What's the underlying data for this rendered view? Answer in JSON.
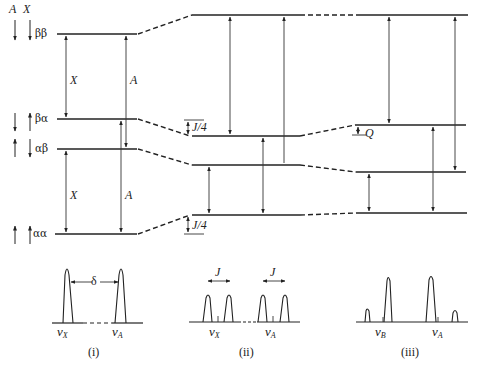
{
  "figure": {
    "spin_header": {
      "a": "A",
      "x": "X"
    },
    "states": [
      {
        "label": "ββ",
        "spins": [
          "down",
          "down"
        ]
      },
      {
        "label": "βα",
        "spins": [
          "down",
          "up"
        ]
      },
      {
        "label": "αβ",
        "spins": [
          "up",
          "down"
        ]
      },
      {
        "label": "αα",
        "spins": [
          "up",
          "up"
        ]
      }
    ],
    "transition_labels": {
      "x": "X",
      "a": "A"
    },
    "coupling_labels": {
      "upper": "J/4",
      "lower": "J/4",
      "q": "Q"
    },
    "spectra": [
      {
        "caption": "(i)",
        "separation_label": "δ",
        "peaks": [
          "ν_X",
          "ν_A"
        ],
        "left_peak_label": "ν",
        "left_peak_sub": "X",
        "right_peak_label": "ν",
        "right_peak_sub": "A"
      },
      {
        "caption": "(ii)",
        "left_spacing_label": "J",
        "right_spacing_label": "J",
        "left_peak_label": "ν",
        "left_peak_sub": "X",
        "right_peak_label": "ν",
        "right_peak_sub": "A"
      },
      {
        "caption": "(iii)",
        "left_peak_label": "ν",
        "left_peak_sub": "B",
        "right_peak_label": "ν",
        "right_peak_sub": "A"
      }
    ]
  }
}
